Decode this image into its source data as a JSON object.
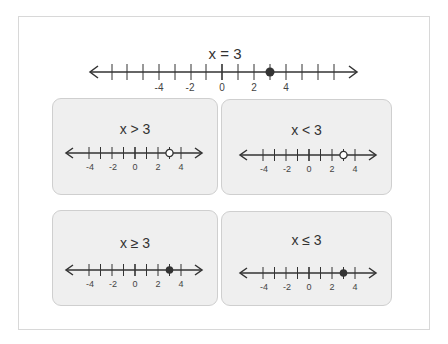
{
  "main": {
    "title": "x = 3",
    "number_line": {
      "min_tick": -7,
      "max_tick": 7,
      "labels": [
        "-4",
        "-2",
        "0",
        "2",
        "4"
      ],
      "point": 3,
      "point_type": "closed"
    }
  },
  "cards": [
    {
      "label": "x > 3",
      "point": 3,
      "point_type": "open"
    },
    {
      "label": "x < 3",
      "point": 3,
      "point_type": "open"
    },
    {
      "label": "x ≥ 3",
      "point": 3,
      "point_type": "closed"
    },
    {
      "label": "x ≤ 3",
      "point": 3,
      "point_type": "closed"
    }
  ],
  "colors": {
    "line": "#333333",
    "card_bg": "#efefef",
    "card_border": "#cfcfcf"
  }
}
